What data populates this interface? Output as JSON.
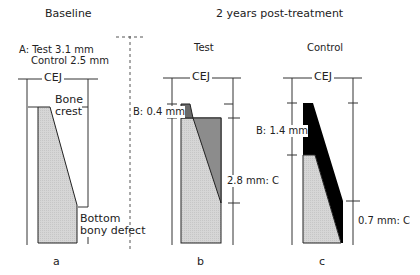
{
  "headers": {
    "baseline": "Baseline",
    "post": "2 years post-treatment"
  },
  "panels": {
    "a": {
      "letter": "a",
      "measure_a_line1": "A: Test 3.1 mm",
      "measure_a_line2": "Control 2.5 mm",
      "cej": "CEJ",
      "bone_crest_line1": "Bone",
      "bone_crest_line2": "crest",
      "bottom_line1": "Bottom",
      "bottom_line2": "bony defect"
    },
    "b": {
      "letter": "b",
      "title": "Test",
      "cej": "CEJ",
      "measure_b": "B: 0.4 mm",
      "measure_c": "2.8 mm: C"
    },
    "c": {
      "letter": "c",
      "title": "Control",
      "cej": "CEJ",
      "measure_b": "B: 1.4 mm",
      "measure_c": "0.7 mm: C"
    }
  },
  "colors": {
    "tooth_light_grey": "#d4d4d4",
    "mid_grey": "#8c8c8c",
    "dark_grey": "#6a6a6a",
    "black": "#000000",
    "line": "#333333"
  }
}
